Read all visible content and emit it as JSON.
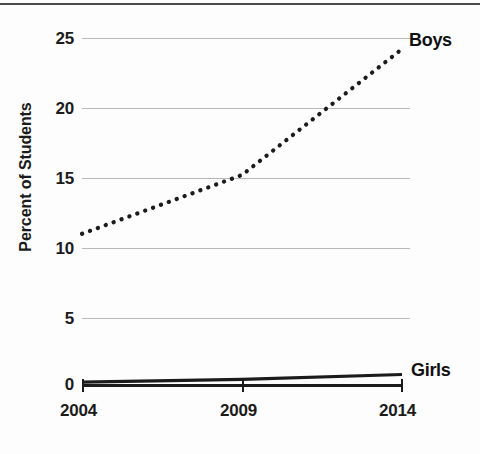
{
  "chart_data": {
    "type": "line",
    "title": "",
    "subtitle": "",
    "xlabel": "",
    "ylabel": "Percent of Students",
    "x": [
      2004,
      2009,
      2014
    ],
    "categories": [
      "2004",
      "2009",
      "2014"
    ],
    "xtick_labels": [
      "2004",
      "2009",
      "2014"
    ],
    "ytick_labels": [
      "0",
      "5",
      "10",
      "15",
      "20",
      "25"
    ],
    "ytick_values": [
      0,
      5,
      10,
      15,
      20,
      25
    ],
    "ylim": [
      0,
      26
    ],
    "xlim": [
      2004,
      2014
    ],
    "grid": "horizontal",
    "legend_position": "inline-right",
    "series": [
      {
        "name": "Boys",
        "label": "Boys",
        "style": "dotted",
        "color": "#1b1b1b",
        "values": [
          10.8,
          15.0,
          24.0
        ]
      },
      {
        "name": "Girls",
        "label": "Girls",
        "style": "solid",
        "color": "#1b1b1b",
        "values": [
          0.2,
          0.4,
          0.75
        ]
      }
    ],
    "annotations": [
      {
        "text": "Boys",
        "at_x": 2014,
        "at_y": 24.0
      },
      {
        "text": "Girls",
        "at_x": 2014,
        "at_y": 0.75
      }
    ]
  }
}
